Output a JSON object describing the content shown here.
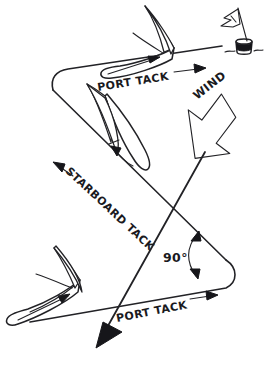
{
  "figure": {
    "title": "Beating to windward — tacking diagram",
    "type": "sailing-tactics-diagram",
    "canvas": {
      "width": 270,
      "height": 368
    },
    "ink_color": "#222226",
    "fill_color": "#16161a",
    "background_color": "#ffffff"
  },
  "labels": {
    "port_tack_top": "PORT TACK",
    "port_tack_bottom": "PORT TACK",
    "starboard_tack": "STARBOARD TACK",
    "wind": "WIND",
    "angle": "90°"
  },
  "icons": {
    "buoy": "buoy-with-flag-icon",
    "wind_arrow": "wind-direction-arrow-icon",
    "angle_arc": "angle-arc-double-arrow-icon",
    "direction_arrow_head": "arrow-head-icon",
    "boat_top": "sailboat-port-tack-icon",
    "boat_middle": "sailboat-starboard-tack-icon",
    "boat_bottom": "sailboat-port-tack-icon"
  },
  "elements": [
    {
      "name": "boat-top",
      "tack": "PORT TACK",
      "heading": "up-right"
    },
    {
      "name": "boat-middle",
      "tack": "STARBOARD TACK",
      "heading": "up-left"
    },
    {
      "name": "boat-bottom",
      "tack": "PORT TACK",
      "heading": "up-right"
    },
    {
      "name": "wind-arrow",
      "direction": "down-left"
    },
    {
      "name": "tacking-angle",
      "value": "90°"
    },
    {
      "name": "windward-mark",
      "type": "buoy with flag"
    }
  ]
}
